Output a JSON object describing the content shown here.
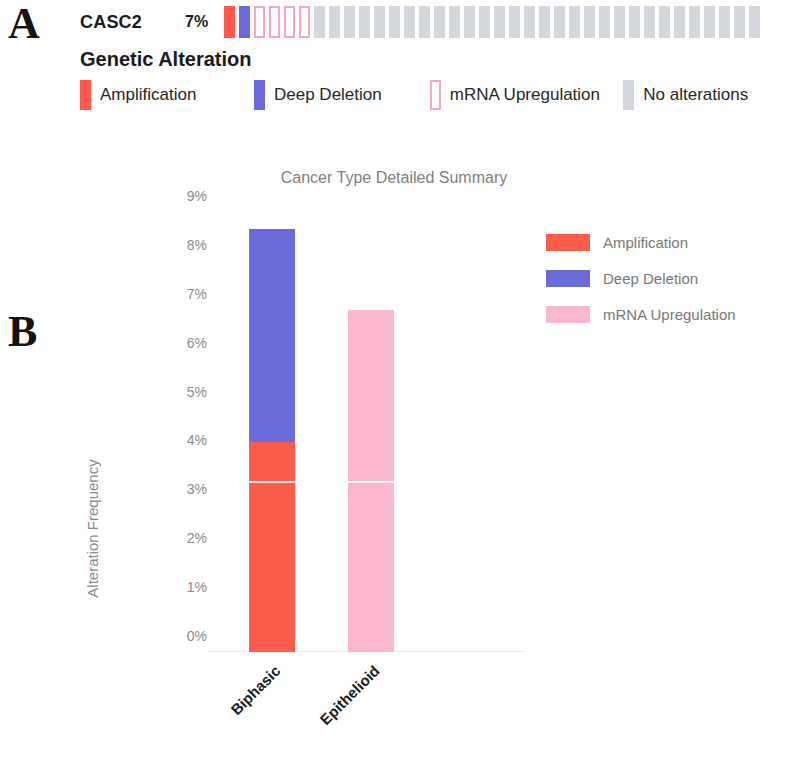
{
  "panels": {
    "a_letter": "A",
    "b_letter": "B"
  },
  "oncoprint": {
    "gene": "CASC2",
    "percent": "7%",
    "legend_title": "Genetic Alteration",
    "cells": [
      "amp",
      "deldeep",
      "mrnaup",
      "mrnaup",
      "mrnaup",
      "mrnaup",
      "none",
      "none",
      "none",
      "none",
      "none",
      "none",
      "none",
      "none",
      "none",
      "none",
      "none",
      "none",
      "none",
      "none",
      "none",
      "none",
      "none",
      "none",
      "none",
      "none",
      "none",
      "none",
      "none",
      "none",
      "none",
      "none",
      "none",
      "none",
      "none",
      "none"
    ],
    "legend_items": [
      {
        "label": "Amplification",
        "type": "amp",
        "color": "#ff5a4d"
      },
      {
        "label": "Deep Deletion",
        "type": "deldeep",
        "color": "#6a6ad8"
      },
      {
        "label": "mRNA Upregulation",
        "type": "mrnaup",
        "color": "#f9a8bb"
      },
      {
        "label": "No alterations",
        "type": "none",
        "color": "#d4d8dd"
      }
    ]
  },
  "chart_data": {
    "type": "bar",
    "stacked": true,
    "title": "Cancer Type Detailed Summary",
    "xlabel": "",
    "ylabel": "Alteration Frequency",
    "categories": [
      "Biphasic",
      "Epithelioid"
    ],
    "ylim": [
      0,
      9
    ],
    "ytick_labels": [
      "0%",
      "1%",
      "2%",
      "3%",
      "4%",
      "5%",
      "6%",
      "7%",
      "8%",
      "9%"
    ],
    "ytick_values": [
      0,
      1,
      2,
      3,
      4,
      5,
      6,
      7,
      8,
      9
    ],
    "grid": false,
    "legend_position": "right",
    "series": [
      {
        "name": "Amplification",
        "color": "#fb5c4b",
        "values": [
          4.3,
          0
        ]
      },
      {
        "name": "Deep Deletion",
        "color": "#6a6ad8",
        "values": [
          4.35,
          0
        ]
      },
      {
        "name": "mRNA Upregulation",
        "color": "#fbb8cc",
        "values": [
          0,
          7.0
        ]
      }
    ],
    "bar_totals": [
      8.65,
      7.0
    ],
    "segment_boundaries": [
      {
        "category": "Biphasic",
        "stops": [
          0,
          3.45,
          4.35,
          8.65
        ]
      },
      {
        "category": "Epithelioid",
        "stops": [
          0,
          3.45,
          7.0
        ]
      }
    ]
  }
}
